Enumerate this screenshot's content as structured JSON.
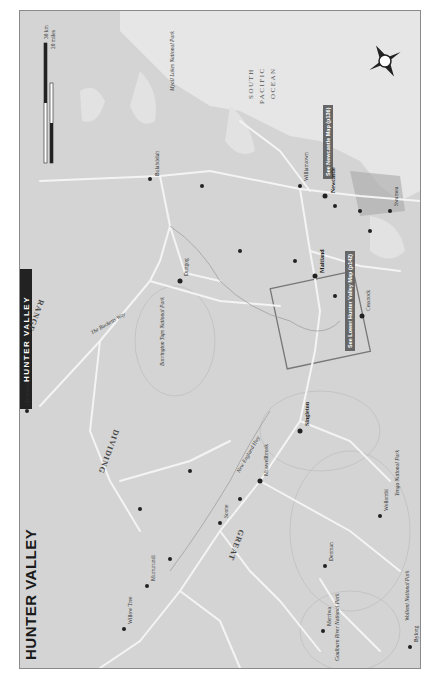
{
  "map": {
    "title": "HUNTER VALLEY",
    "side_tab": "HUNTER VALLEY",
    "ocean_label": [
      "SOUTH",
      "PACIFIC",
      "OCEAN"
    ],
    "scale": {
      "km": "30 km",
      "miles": "20 miles",
      "zero_km": "0",
      "zero_mi": "0"
    },
    "compass": "north-arrow",
    "regions": [
      "GREAT",
      "DIVIDING",
      "RANGE"
    ],
    "callouts": {
      "newcastle": "See Newcastle Map (p136)",
      "lower_hunter": "See Lower Hunter Valley Map (p142)"
    },
    "roads": [
      "New England Hwy",
      "The Bucketts Way",
      "Pacific Hwy"
    ],
    "route_shields": [
      "1",
      "15",
      "15",
      "15"
    ],
    "rivers": [
      "Hunter R",
      "Goulburn",
      "Williams R",
      "Karuah",
      "Myall"
    ],
    "towns": [
      {
        "name": "Tuncurry"
      },
      {
        "name": "Forster"
      },
      {
        "name": "Nabiac"
      },
      {
        "name": "Bulahdelah"
      },
      {
        "name": "Tea Gardens"
      },
      {
        "name": "Hawks Nest"
      },
      {
        "name": "Nelson Bay"
      },
      {
        "name": "Shoal Bay"
      },
      {
        "name": "Williamtown"
      },
      {
        "name": "Stockton"
      },
      {
        "name": "Newcastle"
      },
      {
        "name": "Charlestown"
      },
      {
        "name": "Belmont"
      },
      {
        "name": "Swansea"
      },
      {
        "name": "Toronto"
      },
      {
        "name": "Gloucester"
      },
      {
        "name": "Barrington"
      },
      {
        "name": "Stroud"
      },
      {
        "name": "Stroud Road"
      },
      {
        "name": "Booral"
      },
      {
        "name": "Karuah"
      },
      {
        "name": "Dungog"
      },
      {
        "name": "Clarence Town"
      },
      {
        "name": "Paterson"
      },
      {
        "name": "Raymond Terrace"
      },
      {
        "name": "Morpeth"
      },
      {
        "name": "Maitland"
      },
      {
        "name": "Hexham"
      },
      {
        "name": "Kurri Kurri"
      },
      {
        "name": "Cessnock"
      },
      {
        "name": "Pokolbin"
      },
      {
        "name": "Broke"
      },
      {
        "name": "Singleton"
      },
      {
        "name": "Gresford"
      },
      {
        "name": "Upper Chichester"
      },
      {
        "name": "Chichester Dam"
      },
      {
        "name": "Barrington Guest House"
      },
      {
        "name": "Upper Allyn"
      },
      {
        "name": "Carrow Brook"
      },
      {
        "name": "Bulga"
      },
      {
        "name": "Muswellbrook"
      },
      {
        "name": "Aberdeen"
      },
      {
        "name": "Scone"
      },
      {
        "name": "Wingen"
      },
      {
        "name": "Murrurundi"
      },
      {
        "name": "Willow Tree"
      },
      {
        "name": "Quirindi"
      },
      {
        "name": "Denman"
      },
      {
        "name": "Sandy Hollow"
      },
      {
        "name": "Merriwa"
      },
      {
        "name": "Bylong"
      },
      {
        "name": "Wollombi"
      },
      {
        "name": "Ellerston"
      },
      {
        "name": "Moonan Flat"
      },
      {
        "name": "Wherrol Flat"
      }
    ],
    "parks": [
      "Myall Lakes National Park",
      "Barrington Tops National Park",
      "Yengo National Park",
      "Wollemi National Park",
      "Goulburn River National Park"
    ],
    "lakes": [
      "Wallis Lake",
      "Myall Lake",
      "Grahamstown Lake",
      "Lake Macquarie",
      "Lake Glenbawn",
      "Lake St Clair"
    ],
    "peaks": [
      "Burning Mountain",
      "Mt Barrington (1586m)"
    ],
    "directions": [
      "To Taree (25km)",
      "To Tamworth (50km)",
      "To Werris Creek (18km); Gunnedah (76km)",
      "To Coolah (76km)",
      "To Mudgee (74km)",
      "To Gosford (76km)",
      "To Windsor (70km)",
      "To Sydney (119km)",
      "To The Entrance (19km)",
      "To Walcha, Oxley Wild Rivers NP (135km)"
    ],
    "colors": {
      "land": "#d4d4d4",
      "water": "#e6e6e6",
      "road": "#f4f4f4",
      "park": "#c6c6c6",
      "urban": "#a8a8a8",
      "border": "#8a8a8a",
      "tab": "#222222"
    }
  }
}
